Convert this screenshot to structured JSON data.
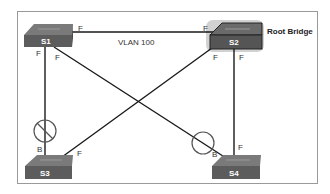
{
  "diagram": {
    "type": "spanning-tree-topology",
    "vlan_label": "VLAN 100",
    "root_label": "Root Bridge",
    "switches": [
      {
        "id": "S1",
        "label": "S1"
      },
      {
        "id": "S2",
        "label": "S2",
        "root": true
      },
      {
        "id": "S3",
        "label": "S3"
      },
      {
        "id": "S4",
        "label": "S4"
      }
    ],
    "links": [
      {
        "from": "S1",
        "to": "S2",
        "from_port": "F",
        "to_port": "F",
        "blocked": false
      },
      {
        "from": "S1",
        "to": "S3",
        "from_port": "F",
        "to_port": "B",
        "blocked": true
      },
      {
        "from": "S1",
        "to": "S4",
        "from_port": "F",
        "to_port": "B",
        "blocked": true
      },
      {
        "from": "S2",
        "to": "S3",
        "from_port": "F",
        "to_port": "F",
        "blocked": false
      },
      {
        "from": "S2",
        "to": "S4",
        "from_port": "F",
        "to_port": "F",
        "blocked": false
      }
    ],
    "port_labels": {
      "s1_s2": "F",
      "s2_s1": "F",
      "s1_s3": "F",
      "s3_s1": "B",
      "s1_s4": "F",
      "s4_s1": "B",
      "s2_s3": "F",
      "s3_s2": "F",
      "s2_s4": "F",
      "s4_s2": "F"
    },
    "colors": {
      "frame": "#9a9a9a",
      "link": "#1a1a1a",
      "switch_top": "#6e6e6e",
      "switch_front": "#5a5a5a",
      "block_symbol": "#555555"
    }
  }
}
